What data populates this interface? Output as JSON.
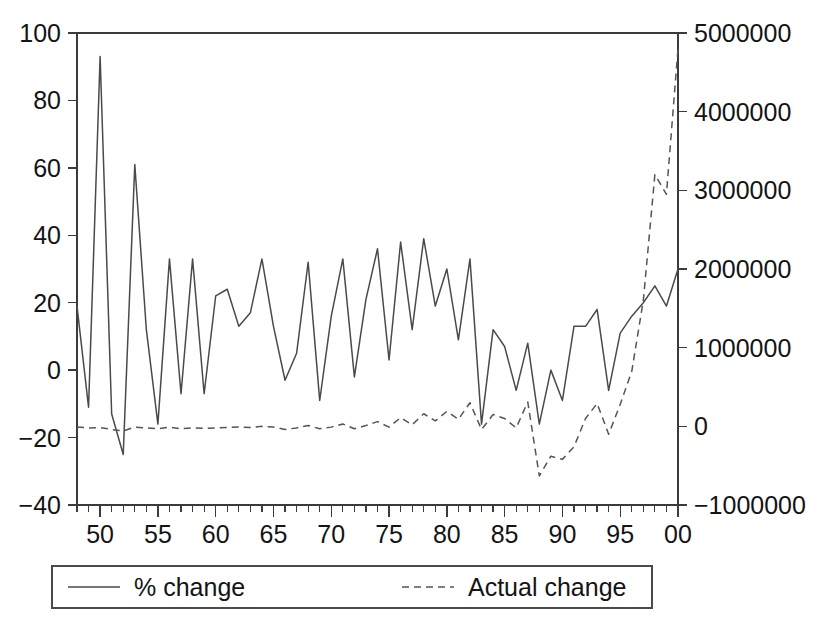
{
  "chart_data": {
    "type": "line",
    "title": "",
    "subtitle": "",
    "xlabel": "",
    "ylabel": "",
    "y2label": "",
    "grid": false,
    "legend_position": "bottom",
    "x": [
      1948,
      1949,
      1950,
      1951,
      1952,
      1953,
      1954,
      1955,
      1956,
      1957,
      1958,
      1959,
      1960,
      1961,
      1962,
      1963,
      1964,
      1965,
      1966,
      1967,
      1968,
      1969,
      1970,
      1971,
      1972,
      1973,
      1974,
      1975,
      1976,
      1977,
      1978,
      1979,
      1980,
      1981,
      1982,
      1983,
      1984,
      1985,
      1986,
      1987,
      1988,
      1989,
      1990,
      1991,
      1992,
      1993,
      1994,
      1995,
      1996,
      1997,
      1998,
      1999,
      2000
    ],
    "x_tick_labels": [
      "50",
      "55",
      "60",
      "65",
      "70",
      "75",
      "80",
      "85",
      "90",
      "95",
      "00"
    ],
    "x_tick_values": [
      1950,
      1955,
      1960,
      1965,
      1970,
      1975,
      1980,
      1985,
      1990,
      1995,
      2000
    ],
    "x_minor_step": 1,
    "xlim": [
      1948,
      2000
    ],
    "ylim": [
      -40,
      100
    ],
    "y_ticks": [
      -40,
      -20,
      0,
      20,
      40,
      60,
      80,
      100
    ],
    "y_tick_labels": [
      "−40",
      "−20",
      "0",
      "20",
      "40",
      "60",
      "80",
      "100"
    ],
    "y2lim": [
      -1000000,
      5000000
    ],
    "y2_ticks": [
      -1000000,
      0,
      1000000,
      2000000,
      3000000,
      4000000,
      5000000
    ],
    "y2_tick_labels": [
      "−1000000",
      "0",
      "1000000",
      "2000000",
      "3000000",
      "4000000",
      "5000000"
    ],
    "series": [
      {
        "name": "% change",
        "axis": "left",
        "style": "solid",
        "color": "#4a4a4a",
        "values": [
          19,
          -11,
          93,
          -13,
          -25,
          61,
          12,
          -16,
          33,
          -7,
          33,
          -7,
          22,
          24,
          13,
          17,
          33,
          13,
          -3,
          5,
          32,
          -9,
          16,
          33,
          -2,
          21,
          36,
          3,
          38,
          12,
          39,
          19,
          30,
          9,
          33,
          -16,
          12,
          7,
          -6,
          8,
          -16,
          0,
          -9,
          13,
          13,
          18,
          -6,
          11,
          16,
          20,
          25,
          19,
          30
        ]
      },
      {
        "name": "Actual change",
        "axis": "right",
        "style": "dashed",
        "color": "#555555",
        "values": [
          -10000,
          -20000,
          -15000,
          -40000,
          -60000,
          -10000,
          -20000,
          -30000,
          -10000,
          -30000,
          -20000,
          -25000,
          -20000,
          -15000,
          -10000,
          -15000,
          0,
          -10000,
          -40000,
          -20000,
          10000,
          -30000,
          -10000,
          30000,
          -30000,
          10000,
          60000,
          -10000,
          110000,
          20000,
          160000,
          70000,
          190000,
          90000,
          300000,
          -40000,
          150000,
          100000,
          -20000,
          310000,
          -630000,
          -380000,
          -420000,
          -260000,
          100000,
          290000,
          -100000,
          280000,
          700000,
          1600000,
          3200000,
          2950000,
          4800000
        ]
      }
    ]
  },
  "legend": {
    "items": [
      {
        "label": "% change",
        "style": "solid"
      },
      {
        "label": "Actual change",
        "style": "dashed"
      }
    ]
  }
}
